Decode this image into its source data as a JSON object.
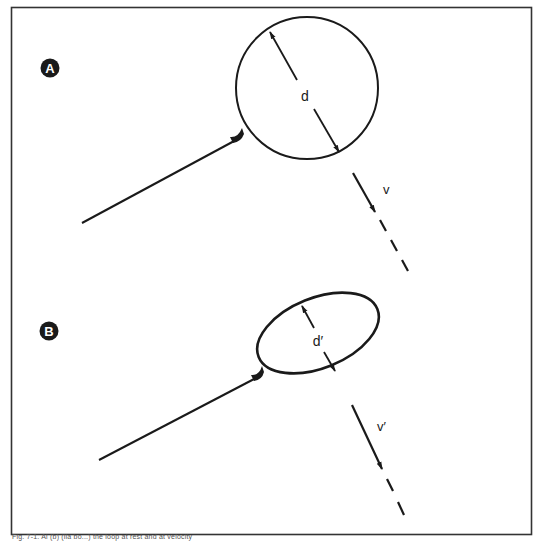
{
  "figure": {
    "panels": [
      {
        "id": "A",
        "badge_label": "A",
        "shape": "circle",
        "dimension_label": "d",
        "velocity_label": "v"
      },
      {
        "id": "B",
        "badge_label": "B",
        "shape": "ellipse",
        "dimension_label": "d′",
        "velocity_label": "v′"
      }
    ],
    "caption": "Fig. 7-1. Ai (b) (lla bo...) the loop at rest and at velocity"
  },
  "colors": {
    "ink": "#1a1a1a",
    "frame": "#333333",
    "background": "#ffffff"
  }
}
